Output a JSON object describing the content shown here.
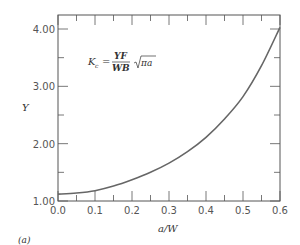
{
  "chart_data": {
    "type": "line",
    "title": "",
    "panel_label": "(a)",
    "xlabel": "a/W",
    "ylabel": "Y",
    "xlim": [
      0.0,
      0.6
    ],
    "ylim": [
      1.0,
      4.1
    ],
    "x_ticks": [
      "0.0",
      "0.1",
      "0.2",
      "0.3",
      "0.4",
      "0.5",
      "0.6"
    ],
    "x_tick_values": [
      0.0,
      0.1,
      0.2,
      0.3,
      0.4,
      0.5,
      0.6
    ],
    "y_ticks": [
      "1.00",
      "2.00",
      "3.00",
      "4.00"
    ],
    "y_tick_values": [
      1.0,
      2.0,
      3.0,
      4.0
    ],
    "x_minor_step": 0.05,
    "y_minor_step": 0.5,
    "grid": false,
    "annotation": {
      "lhs": "K",
      "lhs_sub": "c",
      "eq": "=",
      "numerator": "YF",
      "denominator": "WB",
      "sqrt": "πa"
    },
    "series": [
      {
        "name": "Y",
        "color": "#666666",
        "x": [
          0.0,
          0.05,
          0.1,
          0.15,
          0.2,
          0.25,
          0.3,
          0.35,
          0.4,
          0.45,
          0.5,
          0.55,
          0.6
        ],
        "y": [
          1.12,
          1.14,
          1.18,
          1.26,
          1.37,
          1.5,
          1.66,
          1.86,
          2.11,
          2.43,
          2.82,
          3.36,
          4.03
        ]
      }
    ]
  }
}
